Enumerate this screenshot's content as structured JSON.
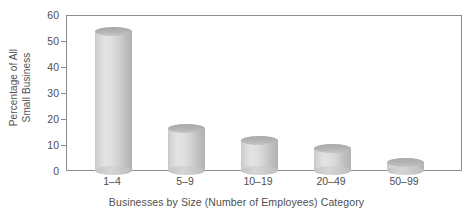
{
  "chart_data": {
    "type": "bar",
    "title": "",
    "xlabel": "Businesses by Size (Number of Employees) Category",
    "ylabel": "Percentage of All Small Business",
    "ylabel_lines": [
      "Percentage of All",
      "Small Business"
    ],
    "categories": [
      "1–4",
      "5–9",
      "10–19",
      "20–49",
      "50–99"
    ],
    "values": [
      55.5,
      18,
      13,
      10,
      4.5
    ],
    "ylim": [
      0,
      60
    ],
    "yticks": [
      0,
      10,
      20,
      30,
      40,
      50,
      60
    ],
    "ytick_labels": [
      "0",
      "10",
      "20",
      "30",
      "40",
      "50",
      "60"
    ],
    "grid": false,
    "legend": null,
    "series": [
      {
        "name": "Percentage of All Small Business",
        "values": [
          55.5,
          18,
          13,
          10,
          4.5
        ]
      }
    ],
    "style": {
      "bar_style": "3d-cylinder",
      "bar_fill": "#d8d8d8",
      "bar_top_fill": "#b0b0b0",
      "axis_color": "#8d8d8d",
      "text_color": "#4f4f4f",
      "background": "#ffffff"
    }
  }
}
